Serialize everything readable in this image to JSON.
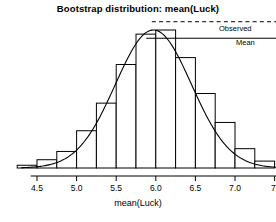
{
  "chart_data": {
    "type": "bar",
    "title": "Bootstrap distribution: mean(Luck)",
    "xlabel": "mean(Luck)",
    "ylabel": "",
    "xlim": [
      4.35,
      7.6
    ],
    "ylim": [
      0,
      1.0
    ],
    "grid": false,
    "legend_position": "right-inside",
    "bin_width": 0.25,
    "categories": [
      "4.375",
      "4.625",
      "4.875",
      "5.125",
      "5.375",
      "5.625",
      "5.875",
      "6.125",
      "6.375",
      "6.625",
      "6.875",
      "7.125",
      "7.375"
    ],
    "bin_edges": [
      4.25,
      4.5,
      4.75,
      5.0,
      5.25,
      5.5,
      5.75,
      6.0,
      6.25,
      6.5,
      6.75,
      7.0,
      7.25,
      7.5
    ],
    "values": [
      0.02,
      0.06,
      0.12,
      0.27,
      0.47,
      0.75,
      0.97,
      1.0,
      0.8,
      0.54,
      0.33,
      0.14,
      0.05
    ],
    "series": [
      {
        "name": "Bootstrap histogram",
        "type": "bar",
        "values": [
          0.02,
          0.06,
          0.12,
          0.27,
          0.47,
          0.75,
          0.97,
          1.0,
          0.8,
          0.54,
          0.33,
          0.14,
          0.05
        ]
      },
      {
        "name": "Normal density curve",
        "type": "line",
        "mean": 5.97,
        "sd": 0.48,
        "peak": 1.0
      }
    ],
    "annotations": [
      {
        "name": "Observed",
        "style": "dashed",
        "orientation": "horizontal",
        "y": 1.06,
        "x_from": 5.95,
        "x_to": 7.55
      },
      {
        "name": "Mean",
        "style": "solid",
        "orientation": "horizontal",
        "y": 0.94,
        "x_from": 5.88,
        "x_to": 7.55
      }
    ],
    "xticks": [
      4.5,
      5.0,
      5.5,
      6.0,
      6.5,
      7.0,
      7.5
    ],
    "xtick_labels": [
      "4.5",
      "5.0",
      "5.5",
      "6.0",
      "6.5",
      "7.0",
      "7."
    ],
    "colors": {
      "bar_stroke": "#000000",
      "bar_fill": "#ffffff",
      "curve": "#000000",
      "axis": "#000000",
      "text": "#000000"
    }
  },
  "labels": {
    "observed": "Observed",
    "mean": "Mean"
  }
}
